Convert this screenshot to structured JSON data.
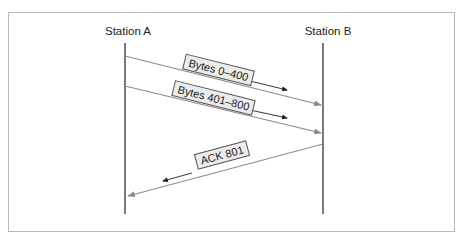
{
  "diagram": {
    "type": "sequence",
    "stations": [
      {
        "id": "A",
        "label": "Station A"
      },
      {
        "id": "B",
        "label": "Station B"
      }
    ],
    "messages": [
      {
        "from": "A",
        "to": "B",
        "label": "Bytes 0–400"
      },
      {
        "from": "A",
        "to": "B",
        "label": "Bytes 401–800"
      },
      {
        "from": "B",
        "to": "A",
        "label": "ACK 801"
      }
    ],
    "colors": {
      "lifeline": "#333333",
      "message_line": "#8c8c8c",
      "direction_arrow": "#222222",
      "label_fill": "#ececec",
      "label_border": "#555555",
      "frame_border": "#b8b8b8"
    }
  }
}
